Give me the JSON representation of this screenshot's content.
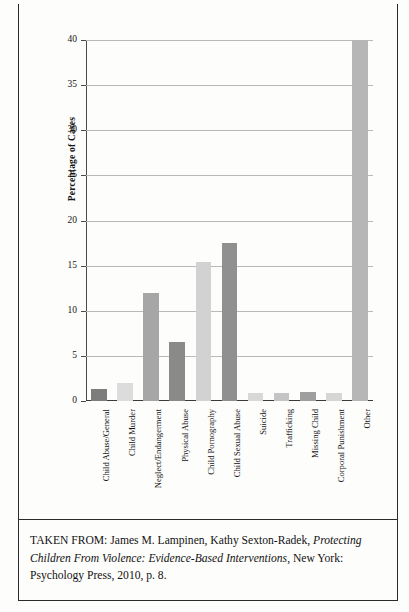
{
  "figure": {
    "y_axis_title": "Percentage of Cases"
  },
  "chart_data": {
    "type": "bar",
    "title": "",
    "xlabel": "",
    "ylabel": "Percentage of Cases",
    "ylim": [
      0,
      40
    ],
    "yticks": [
      0,
      5,
      10,
      15,
      20,
      25,
      30,
      35,
      40
    ],
    "ytick_labels": [
      "0",
      "5",
      "10",
      "15",
      "20",
      "25",
      "30",
      "35",
      "40"
    ],
    "grid": true,
    "legend": "none",
    "categories": [
      "Child Abuse/General",
      "Child Murder",
      "Neglect/Endangerment",
      "Physical Abuse",
      "Child Pornography",
      "Child Sexual Abuse",
      "Suicide",
      "Trafficking",
      "Missing Child",
      "Corporal Punishment",
      "Other"
    ],
    "values": [
      1.3,
      2.0,
      12.0,
      6.5,
      15.4,
      17.5,
      0.9,
      0.9,
      1.0,
      0.9,
      40.0
    ],
    "bar_colors": [
      "#7d7d7d",
      "#dcdcdc",
      "#a6a6a6",
      "#8a8a8a",
      "#d2d2d2",
      "#909090",
      "#d8d8d8",
      "#c4c4c4",
      "#9e9e9e",
      "#d6d6d6",
      "#b6b6b6"
    ]
  },
  "caption": {
    "prefix": "TAKEN FROM: James M. Lampinen, Kathy Sexton-Radek, ",
    "title_italic": "Protecting Children From Violence: Evidence-Based Interventions",
    "suffix": ", New York: Psychology Press, 2010, p. 8."
  }
}
